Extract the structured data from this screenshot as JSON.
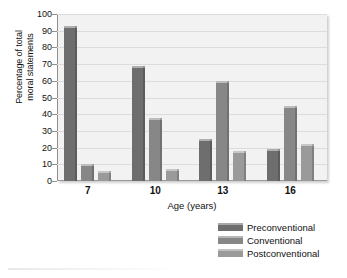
{
  "chart_data": {
    "type": "bar",
    "title": "",
    "xlabel": "Age (years)",
    "ylabel": "Percentage of total moral statements",
    "ylabel_lines": [
      "Percentage of total",
      "moral statements"
    ],
    "categories": [
      "7",
      "10",
      "13",
      "16"
    ],
    "ylim": [
      0,
      100
    ],
    "yticks": [
      0,
      10,
      20,
      30,
      40,
      50,
      60,
      70,
      80,
      90,
      100
    ],
    "grid": true,
    "legend_position": "bottom-right",
    "series": [
      {
        "name": "Preconventional",
        "color": "#6e6e6e",
        "values": [
          93,
          69,
          25,
          19
        ]
      },
      {
        "name": "Conventional",
        "color": "#878787",
        "values": [
          10,
          38,
          60,
          45
        ]
      },
      {
        "name": "Postconventional",
        "color": "#9a9a9a",
        "values": [
          6,
          7,
          18,
          22
        ]
      }
    ]
  },
  "axes": {
    "ylabel_line1": "Percentage of total",
    "ylabel_line2": "moral statements",
    "xlabel": "Age (years)"
  },
  "colors": {
    "plot_background": "#f2f2f2",
    "gridline": "#dcdcdc",
    "axis": "#8f8f8f",
    "text": "#111111"
  }
}
